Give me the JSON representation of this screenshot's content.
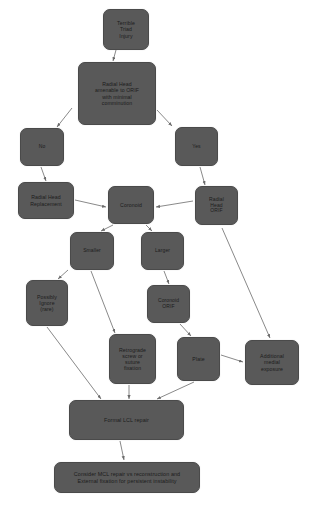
{
  "diagram": {
    "type": "flowchart",
    "background_color": "#ffffff",
    "node_fill_color": "#595959",
    "node_text_color": "#1c1c1c",
    "edge_color": "#6b6b6b",
    "nodes": [
      {
        "id": "terrible-triad-injury",
        "label": "Terrible\nTriad\nInjury",
        "x": 103,
        "y": 9,
        "w": 46,
        "h": 41
      },
      {
        "id": "radial-head-amenable",
        "label": "Radial Head\namenable to ORIF\nwith minimal\ncomminution",
        "x": 78,
        "y": 62,
        "w": 78,
        "h": 63
      },
      {
        "id": "no",
        "label": "No",
        "x": 20,
        "y": 128,
        "w": 44,
        "h": 38
      },
      {
        "id": "yes",
        "label": "Yes",
        "x": 175,
        "y": 127,
        "w": 43,
        "h": 39
      },
      {
        "id": "radial-head-replacement",
        "label": "Radial Head\nReplacement",
        "x": 18,
        "y": 182,
        "w": 56,
        "h": 37
      },
      {
        "id": "coronoid",
        "label": "Coronoid",
        "x": 108,
        "y": 186,
        "w": 46,
        "h": 38
      },
      {
        "id": "radial-head-orif",
        "label": "Radial\nHead\nORIF",
        "x": 195,
        "y": 186,
        "w": 43,
        "h": 39
      },
      {
        "id": "smaller",
        "label": "Smaller",
        "x": 70,
        "y": 232,
        "w": 44,
        "h": 38
      },
      {
        "id": "larger",
        "label": "Larger",
        "x": 141,
        "y": 232,
        "w": 43,
        "h": 38
      },
      {
        "id": "possibly-ignore-rare",
        "label": "Possibly\nIgnore\n(rare)",
        "x": 26,
        "y": 280,
        "w": 42,
        "h": 46
      },
      {
        "id": "coronoid-orif",
        "label": "Coronoid\nORIF",
        "x": 147,
        "y": 285,
        "w": 43,
        "h": 38
      },
      {
        "id": "retrograde-screw-suture-fixation",
        "label": "Retrograde\nscrew or\nsuture\nfixation",
        "x": 109,
        "y": 334,
        "w": 47,
        "h": 50
      },
      {
        "id": "plate",
        "label": "Plate",
        "x": 177,
        "y": 337,
        "w": 43,
        "h": 44
      },
      {
        "id": "additional-medial-exposure",
        "label": "Additional\nmedial\nexposure",
        "x": 245,
        "y": 340,
        "w": 54,
        "h": 45
      },
      {
        "id": "formal-lcl-repair",
        "label": "Formal LCL repair",
        "x": 69,
        "y": 400,
        "w": 115,
        "h": 40
      },
      {
        "id": "consider-mcl-repair",
        "label": "Consider MCL repair vs reconstruction and\nExternal fixation for persistent instability",
        "x": 54,
        "y": 462,
        "w": 146,
        "h": 31
      }
    ],
    "edges": [
      {
        "from": "terrible-triad-injury",
        "to": "radial-head-amenable",
        "x1": 116,
        "y1": 50,
        "x2": 113,
        "y2": 61
      },
      {
        "from": "radial-head-amenable",
        "to": "no",
        "x1": 72,
        "y1": 108,
        "x2": 57,
        "y2": 127
      },
      {
        "from": "radial-head-amenable",
        "to": "yes",
        "x1": 157,
        "y1": 110,
        "x2": 172,
        "y2": 126
      },
      {
        "from": "no",
        "to": "radial-head-replacement",
        "x1": 41,
        "y1": 167,
        "x2": 46,
        "y2": 181
      },
      {
        "from": "yes",
        "to": "radial-head-orif",
        "x1": 200,
        "y1": 167,
        "x2": 205,
        "y2": 185
      },
      {
        "from": "radial-head-replacement",
        "to": "coronoid",
        "x1": 75,
        "y1": 200,
        "x2": 106,
        "y2": 207
      },
      {
        "from": "radial-head-orif",
        "to": "coronoid",
        "x1": 193,
        "y1": 201,
        "x2": 156,
        "y2": 207
      },
      {
        "from": "coronoid",
        "to": "smaller",
        "x1": 113,
        "y1": 225,
        "x2": 101,
        "y2": 231
      },
      {
        "from": "coronoid",
        "to": "larger",
        "x1": 146,
        "y1": 225,
        "x2": 152,
        "y2": 231
      },
      {
        "from": "smaller",
        "to": "possibly-ignore-rare",
        "x1": 68,
        "y1": 270,
        "x2": 58,
        "y2": 279
      },
      {
        "from": "smaller",
        "to": "retrograde-screw-suture-fixation",
        "x1": 91,
        "y1": 271,
        "x2": 115,
        "y2": 333
      },
      {
        "from": "larger",
        "to": "coronoid-orif",
        "x1": 164,
        "y1": 271,
        "x2": 169,
        "y2": 284
      },
      {
        "from": "coronoid-orif",
        "to": "plate",
        "x1": 180,
        "y1": 324,
        "x2": 191,
        "y2": 336
      },
      {
        "from": "possibly-ignore-rare",
        "to": "formal-lcl-repair",
        "x1": 47,
        "y1": 327,
        "x2": 101,
        "y2": 399
      },
      {
        "from": "retrograde-screw-suture-fixation",
        "to": "formal-lcl-repair",
        "x1": 129,
        "y1": 385,
        "x2": 129,
        "y2": 399
      },
      {
        "from": "plate",
        "to": "additional-medial-exposure",
        "x1": 221,
        "y1": 355,
        "x2": 243,
        "y2": 362
      },
      {
        "from": "plate",
        "to": "formal-lcl-repair",
        "x1": 194,
        "y1": 382,
        "x2": 157,
        "y2": 399
      },
      {
        "from": "radial-head-orif",
        "to": "additional-medial-exposure",
        "x1": 222,
        "y1": 228,
        "x2": 270,
        "y2": 338
      },
      {
        "from": "formal-lcl-repair",
        "to": "consider-mcl-repair",
        "x1": 120,
        "y1": 441,
        "x2": 124,
        "y2": 460
      }
    ],
    "caption": ""
  }
}
